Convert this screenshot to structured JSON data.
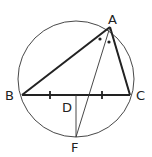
{
  "diagram": {
    "type": "geometry",
    "labels": {
      "A": "A",
      "B": "B",
      "C": "C",
      "D": "D",
      "F": "F"
    },
    "colors": {
      "stroke": "#222222",
      "background": "#ffffff"
    }
  }
}
